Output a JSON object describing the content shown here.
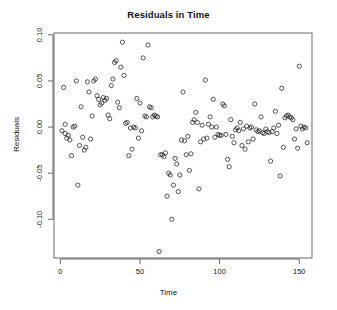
{
  "chart_data": {
    "type": "scatter",
    "title": "Residuals in Time",
    "xlabel": "Time",
    "ylabel": "Residuals",
    "xlim": [
      -4,
      158
    ],
    "ylim": [
      -0.142,
      0.102
    ],
    "grid": false,
    "legend": null,
    "marker": "open-circle",
    "xticks": [
      0,
      50,
      100,
      150
    ],
    "xtick_labels": [
      "0",
      "50",
      "100",
      "150"
    ],
    "yticks": [
      0.1,
      0.05,
      0.0,
      -0.05,
      -0.1
    ],
    "ytick_labels": [
      "0.10",
      "0.05",
      "0.00",
      "-0.05",
      "-0.10"
    ],
    "x": [
      1,
      2,
      3,
      3,
      4,
      5,
      6,
      7,
      8,
      9,
      10,
      11,
      12,
      13,
      14,
      15,
      16,
      17,
      18,
      19,
      20,
      21,
      22,
      23,
      24,
      25,
      26,
      27,
      28,
      29,
      30,
      31,
      32,
      33,
      34,
      35,
      36,
      37,
      38,
      39,
      40,
      41,
      42,
      43,
      44,
      45,
      46,
      47,
      48,
      49,
      50,
      51,
      52,
      53,
      54,
      55,
      56,
      57,
      58,
      59,
      60,
      61,
      62,
      63,
      64,
      65,
      66,
      67,
      68,
      69,
      70,
      71,
      72,
      73,
      74,
      75,
      76,
      77,
      78,
      79,
      80,
      81,
      82,
      83,
      84,
      85,
      86,
      87,
      88,
      89,
      90,
      91,
      92,
      93,
      94,
      95,
      96,
      97,
      98,
      99,
      100,
      101,
      102,
      103,
      104,
      105,
      106,
      107,
      108,
      109,
      110,
      111,
      112,
      113,
      114,
      115,
      116,
      117,
      118,
      119,
      120,
      121,
      122,
      123,
      124,
      125,
      126,
      127,
      128,
      129,
      130,
      131,
      132,
      133,
      134,
      135,
      136,
      137,
      138,
      139,
      140,
      141,
      142,
      143,
      144,
      145,
      146,
      147,
      148,
      149,
      150,
      151,
      152,
      153,
      154,
      155
    ],
    "y": [
      -0.004,
      0.043,
      -0.007,
      0.003,
      -0.012,
      -0.009,
      -0.014,
      -0.031,
      0.0,
      0.001,
      0.05,
      -0.063,
      -0.02,
      0.022,
      -0.011,
      -0.025,
      -0.022,
      0.049,
      0.038,
      -0.013,
      0.012,
      0.05,
      0.052,
      0.034,
      0.03,
      0.024,
      0.026,
      0.032,
      0.029,
      0.031,
      0.013,
      0.009,
      0.045,
      0.052,
      0.07,
      0.072,
      0.027,
      0.021,
      0.065,
      0.092,
      0.056,
      0.004,
      0.005,
      -0.031,
      -0.001,
      -0.024,
      0.0,
      -0.001,
      0.031,
      -0.012,
      0.026,
      -0.004,
      0.075,
      0.012,
      0.011,
      0.089,
      0.022,
      0.021,
      0.011,
      0.013,
      0.012,
      0.011,
      -0.135,
      -0.03,
      -0.03,
      -0.032,
      -0.028,
      -0.075,
      -0.05,
      -0.052,
      -0.1,
      -0.063,
      -0.034,
      -0.04,
      -0.07,
      -0.052,
      -0.014,
      0.038,
      -0.015,
      -0.03,
      -0.01,
      -0.047,
      -0.029,
      0.005,
      0.008,
      0.016,
      0.005,
      -0.067,
      -0.016,
      0.002,
      -0.013,
      0.051,
      -0.012,
      0.003,
      0.011,
      0.0,
      0.03,
      -0.011,
      0.0,
      -0.008,
      -0.009,
      -0.009,
      0.025,
      0.023,
      -0.008,
      -0.035,
      -0.043,
      0.008,
      -0.01,
      -0.017,
      -0.003,
      -0.001,
      -0.004,
      0.005,
      -0.02,
      -0.002,
      -0.024,
      0.001,
      -0.016,
      -0.001,
      0.0,
      -0.013,
      0.025,
      -0.003,
      -0.005,
      -0.004,
      0.011,
      -0.006,
      -0.007,
      -0.002,
      -0.005,
      -0.006,
      -0.037,
      -0.005,
      -0.001,
      0.017,
      -0.007,
      0.002,
      -0.053,
      0.042,
      -0.022,
      0.01,
      0.012,
      0.013,
      0.011,
      0.01,
      0.008,
      -0.013,
      -0.002,
      -0.023,
      0.066,
      0.001,
      -0.002,
      0.0,
      -0.001,
      -0.017,
      -0.016,
      -0.006
    ]
  }
}
